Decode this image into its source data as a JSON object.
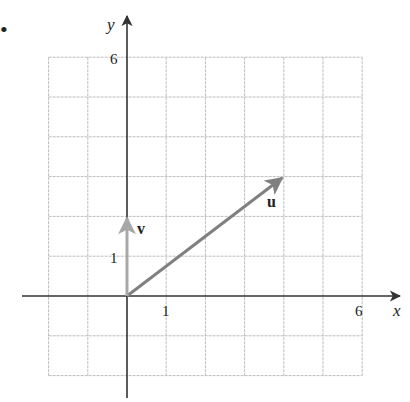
{
  "figure": {
    "bullet": "•",
    "axes": {
      "x_label": "x",
      "y_label": "y",
      "x_range": [
        -2,
        6
      ],
      "y_range": [
        -2,
        6
      ],
      "x_ticks_labeled": [
        {
          "value": 1,
          "label": "1"
        },
        {
          "value": 6,
          "label": "6"
        }
      ],
      "y_ticks_labeled": [
        {
          "value": 1,
          "label": "1"
        },
        {
          "value": 6,
          "label": "6"
        }
      ]
    },
    "grid": {
      "on": true,
      "step": 1,
      "color": "#bdbdbd"
    },
    "vectors": [
      {
        "name": "u",
        "label": "u",
        "from": [
          0,
          0
        ],
        "to": [
          4,
          3
        ],
        "color": "#808080"
      },
      {
        "name": "v",
        "label": "v",
        "from": [
          0,
          0
        ],
        "to": [
          0,
          2
        ],
        "color": "#a8a8a8"
      }
    ],
    "colors": {
      "axis": "#333333",
      "text": "#222222"
    }
  }
}
